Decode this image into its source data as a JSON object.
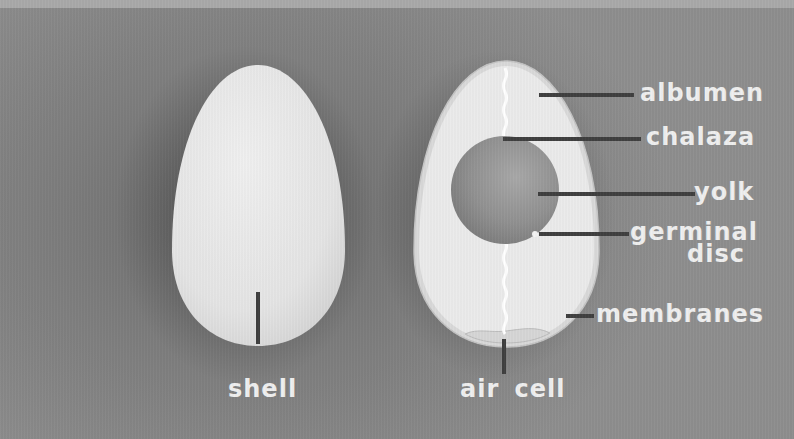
{
  "colors": {
    "background": "#7e7e7e",
    "egg_shell": "#e6e6e6",
    "albumen": "#e9e9e9",
    "yolk": "#8f8f8f",
    "leader_line": "#3f3f3f",
    "label_text": "#efefef"
  },
  "eggs": {
    "whole": {
      "labels": {
        "shell": "shell"
      }
    },
    "cross_section": {
      "labels": {
        "albumen": "albumen",
        "chalaza": "chalaza",
        "yolk": "yolk",
        "germinal_disc_line1": "germinal",
        "germinal_disc_line2": "disc",
        "membranes": "membranes",
        "air_cell": "air cell"
      }
    }
  }
}
